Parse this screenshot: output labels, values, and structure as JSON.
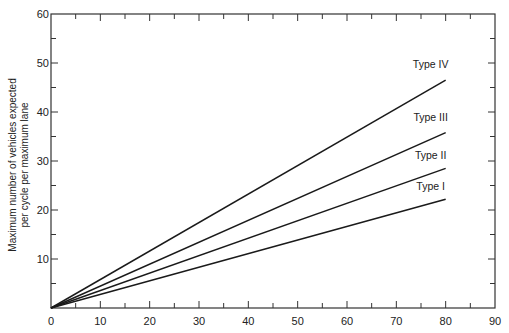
{
  "chart_data": {
    "type": "line",
    "title": "",
    "xlabel": "",
    "ylabel": [
      "Maximum number of vehicles expected",
      "per cycle per maximum lane"
    ],
    "xlim": [
      0,
      90
    ],
    "ylim": [
      0,
      60
    ],
    "x_ticks": [
      0,
      10,
      20,
      30,
      40,
      50,
      60,
      70,
      80,
      90
    ],
    "y_ticks": [
      10,
      20,
      30,
      40,
      50,
      60
    ],
    "minor_tick_step": 5,
    "grid": false,
    "legend": "inline labels at line ends",
    "series": [
      {
        "name": "Type IV",
        "x": [
          0,
          80
        ],
        "values": [
          0,
          46.5
        ]
      },
      {
        "name": "Type III",
        "x": [
          0,
          80
        ],
        "values": [
          0,
          35.8
        ]
      },
      {
        "name": "Type II",
        "x": [
          0,
          80
        ],
        "values": [
          0,
          28.5
        ]
      },
      {
        "name": "Type I",
        "x": [
          0,
          80
        ],
        "values": [
          0,
          22.2
        ]
      }
    ]
  },
  "labels": {
    "x_ticks": [
      "0",
      "10",
      "20",
      "30",
      "40",
      "50",
      "60",
      "70",
      "80",
      "90"
    ],
    "y_ticks": [
      "10",
      "20",
      "30",
      "40",
      "50",
      "60"
    ],
    "ylabel_line1": "Maximum number of vehicles expected",
    "ylabel_line2": "per cycle per maximum lane",
    "series": [
      "Type IV",
      "Type III",
      "Type II",
      "Type I"
    ]
  },
  "colors": {
    "line": "#1a1a1a",
    "axis": "#333333",
    "background": "#ffffff"
  }
}
